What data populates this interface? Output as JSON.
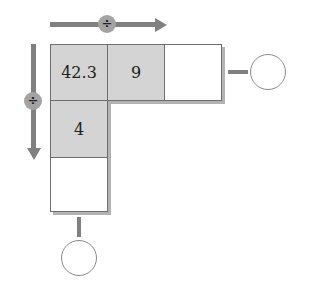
{
  "diagram": {
    "type": "division-arrow-grid",
    "colors": {
      "arrow": "#808080",
      "filled_cell": "#d4d4d4",
      "empty_cell": "#ffffff",
      "operator_circle": "#a3a3a3"
    },
    "horizontal_operation": {
      "direction": "right",
      "operator": "÷"
    },
    "vertical_operation": {
      "direction": "down",
      "operator": "÷"
    },
    "grid": {
      "row1": [
        {
          "value": "42.3",
          "filled": true
        },
        {
          "value": "9",
          "filled": true
        },
        {
          "value": "",
          "filled": false
        }
      ],
      "row2": [
        {
          "value": "4",
          "filled": true
        }
      ],
      "row3": [
        {
          "value": "",
          "filled": false
        }
      ]
    },
    "answer_circles": [
      {
        "position": "right",
        "value": ""
      },
      {
        "position": "bottom",
        "value": ""
      }
    ]
  }
}
